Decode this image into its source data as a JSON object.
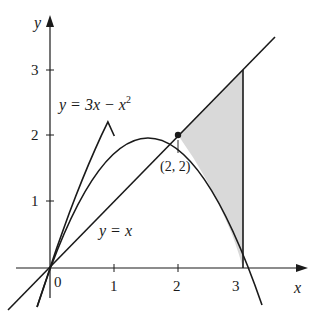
{
  "figure": {
    "colors": {
      "ink": "#1a1a1a",
      "shade": "#d9d9d9",
      "background": "#ffffff"
    },
    "axes": {
      "x_label": "x",
      "y_label": "y",
      "origin_label": "0",
      "x_ticks": [
        {
          "value": 1,
          "label": "1"
        },
        {
          "value": 2,
          "label": "2"
        },
        {
          "value": 3,
          "label": "3"
        }
      ],
      "y_ticks": [
        {
          "value": 1,
          "label": "1"
        },
        {
          "value": 2,
          "label": "2"
        },
        {
          "value": 3,
          "label": "3"
        }
      ]
    },
    "curves": {
      "parabola": {
        "label_lhs": "y = 3x − x",
        "label_exp": "2",
        "equation": "y = 3x - x^2"
      },
      "line": {
        "label": "y = x",
        "equation": "y = x"
      }
    },
    "intersection_point": {
      "label": "(2, 2)",
      "x": 2,
      "y": 2
    },
    "shaded_region": {
      "x_from": 2,
      "x_to": 3,
      "upper": "y = x",
      "lower": "y = 3x - x^2"
    }
  }
}
